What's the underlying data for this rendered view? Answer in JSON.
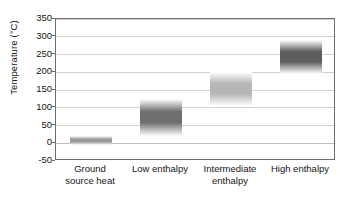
{
  "chart_data": {
    "type": "bar",
    "orientation": "vertical-range-bands",
    "title": "",
    "xlabel": "",
    "ylabel": "Temperature (°C)",
    "ylim": [
      -50,
      350
    ],
    "ytick_step": 50,
    "ytick_labels": [
      "350",
      "300",
      "250",
      "200",
      "150",
      "100",
      "50",
      "0",
      "-50"
    ],
    "ytick_values": [
      350,
      300,
      250,
      200,
      150,
      100,
      50,
      0,
      -50
    ],
    "grid": true,
    "legend": false,
    "categories": [
      "Ground source heat",
      "Low enthalpy",
      "Intermediate enthalpy",
      "High enthalpy"
    ],
    "category_lines": [
      [
        "Ground",
        "source heat"
      ],
      [
        "Low enthalpy"
      ],
      [
        "Intermediate",
        "enthalpy"
      ],
      [
        "High enthalpy"
      ]
    ],
    "series": [
      {
        "name": "Temperature range",
        "bands": [
          {
            "category": "Ground source heat",
            "low": -5,
            "high": 20,
            "shade": "medium-light"
          },
          {
            "category": "Low enthalpy",
            "low": 20,
            "high": 125,
            "shade": "dark"
          },
          {
            "category": "Intermediate enthalpy",
            "low": 105,
            "high": 200,
            "shade": "light"
          },
          {
            "category": "High enthalpy",
            "low": 195,
            "high": 290,
            "shade": "darkest"
          }
        ]
      }
    ],
    "values_low": [
      -5,
      20,
      105,
      195
    ],
    "values_high": [
      20,
      125,
      200,
      290
    ],
    "colors": {
      "band_core_ground": "#9a9a9a",
      "band_core_low": "#6f6f6f",
      "band_core_intermediate": "#b6b6b6",
      "band_core_high": "#5e5e5e",
      "gridline": "#d2d2d2",
      "axis": "#6e6e6e",
      "text": "#161616",
      "background": "#ffffff"
    }
  }
}
